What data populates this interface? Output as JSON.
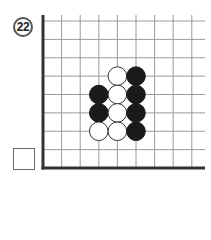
{
  "problem": {
    "number": "22"
  },
  "board": {
    "visible_columns": 9,
    "visible_rows": 8,
    "edges": [
      "left",
      "bottom"
    ],
    "stones": [
      {
        "color": "white",
        "col": 4,
        "row": 3
      },
      {
        "color": "black",
        "col": 5,
        "row": 3
      },
      {
        "color": "black",
        "col": 3,
        "row": 4
      },
      {
        "color": "white",
        "col": 4,
        "row": 4
      },
      {
        "color": "black",
        "col": 5,
        "row": 4
      },
      {
        "color": "black",
        "col": 3,
        "row": 5
      },
      {
        "color": "white",
        "col": 4,
        "row": 5
      },
      {
        "color": "black",
        "col": 5,
        "row": 5
      },
      {
        "color": "white",
        "col": 3,
        "row": 6
      },
      {
        "color": "white",
        "col": 4,
        "row": 6
      },
      {
        "color": "black",
        "col": 5,
        "row": 6
      }
    ],
    "colors": {
      "line": "#9a9a9a",
      "edge": "#333333",
      "black_stone": "#1a1a1a",
      "white_stone": "#ffffff"
    }
  },
  "answer_box": {
    "value": ""
  }
}
